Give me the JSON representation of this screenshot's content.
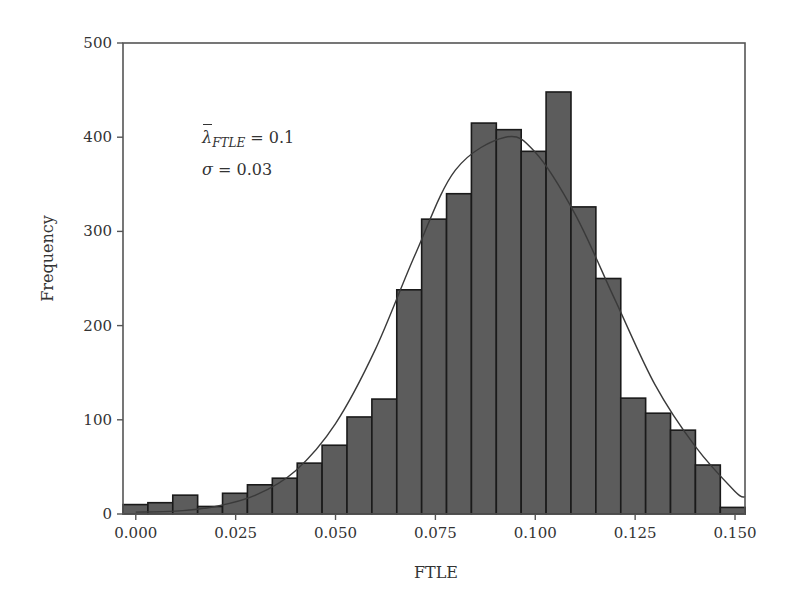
{
  "chart_data": {
    "type": "bar",
    "subtype": "histogram_with_normal_fit",
    "title": "",
    "xlabel": "FTLE",
    "ylabel": "Frequency",
    "xlim": [
      -0.0032,
      0.1525
    ],
    "ylim": [
      0,
      500
    ],
    "x_ticks": [
      0.0,
      0.025,
      0.05,
      0.075,
      0.1,
      0.125,
      0.15
    ],
    "x_tick_labels": [
      "0.000",
      "0.025",
      "0.050",
      "0.075",
      "0.100",
      "0.125",
      "0.150"
    ],
    "y_ticks": [
      0,
      100,
      200,
      300,
      400,
      500
    ],
    "y_tick_labels": [
      "0",
      "100",
      "200",
      "300",
      "400",
      "500"
    ],
    "grid": false,
    "legend": null,
    "bin_width": 0.00623,
    "bin_start": -0.0032,
    "bins": [
      {
        "x_center": 0.0,
        "value": 10
      },
      {
        "x_center": 0.0062,
        "value": 12
      },
      {
        "x_center": 0.0125,
        "value": 20
      },
      {
        "x_center": 0.0187,
        "value": 8
      },
      {
        "x_center": 0.0249,
        "value": 22
      },
      {
        "x_center": 0.0312,
        "value": 31
      },
      {
        "x_center": 0.0374,
        "value": 38
      },
      {
        "x_center": 0.0436,
        "value": 54
      },
      {
        "x_center": 0.0498,
        "value": 73
      },
      {
        "x_center": 0.0561,
        "value": 103
      },
      {
        "x_center": 0.0623,
        "value": 122
      },
      {
        "x_center": 0.0685,
        "value": 238
      },
      {
        "x_center": 0.0748,
        "value": 313
      },
      {
        "x_center": 0.081,
        "value": 340
      },
      {
        "x_center": 0.0872,
        "value": 415
      },
      {
        "x_center": 0.0935,
        "value": 408
      },
      {
        "x_center": 0.0997,
        "value": 385
      },
      {
        "x_center": 0.1059,
        "value": 448
      },
      {
        "x_center": 0.1122,
        "value": 326
      },
      {
        "x_center": 0.1184,
        "value": 250
      },
      {
        "x_center": 0.1246,
        "value": 123
      },
      {
        "x_center": 0.1309,
        "value": 107
      },
      {
        "x_center": 0.1371,
        "value": 89
      },
      {
        "x_center": 0.1433,
        "value": 52
      },
      {
        "x_center": 0.1496,
        "value": 7
      }
    ],
    "fit_curve": {
      "type": "normal",
      "peak_x": 0.0925,
      "peak_y": 400,
      "sigma_x": 0.021,
      "points": [
        [
          0.0,
          2
        ],
        [
          0.01,
          3
        ],
        [
          0.02,
          8
        ],
        [
          0.03,
          20
        ],
        [
          0.04,
          46
        ],
        [
          0.05,
          96
        ],
        [
          0.06,
          175
        ],
        [
          0.07,
          276
        ],
        [
          0.08,
          365
        ],
        [
          0.0925,
          400
        ],
        [
          0.1,
          384
        ],
        [
          0.11,
          318
        ],
        [
          0.12,
          227
        ],
        [
          0.13,
          137
        ],
        [
          0.14,
          72
        ],
        [
          0.15,
          24
        ],
        [
          0.1525,
          18
        ]
      ]
    },
    "annotations": [
      {
        "text": "λ̄_FTLE = 0.1",
        "symbol": "λ",
        "subscript": "FTLE",
        "value": "0.1",
        "x": 0.017,
        "y": 400
      },
      {
        "text": "σ = 0.03",
        "symbol": "σ",
        "value": "0.03",
        "x": 0.017,
        "y": 360
      }
    ],
    "colors": {
      "bar_fill": "#5c5c5c",
      "bar_edge": "#1a1a1a",
      "curve": "#3a3a3a",
      "axis": "#555555"
    }
  },
  "annotation": {
    "mean_symbol": "λ",
    "mean_subscript": "FTLE",
    "mean_eq": " = 0.1",
    "sigma_symbol": "σ",
    "sigma_eq": " = 0.03"
  }
}
